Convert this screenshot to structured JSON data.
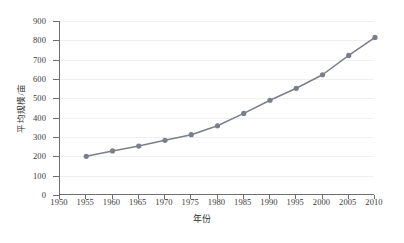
{
  "chart_data": {
    "type": "line",
    "title": "",
    "xlabel": "年份",
    "ylabel": "平均规模/亩",
    "xlim": [
      1950,
      2010
    ],
    "ylim": [
      0,
      900
    ],
    "xticks": [
      1950,
      1955,
      1960,
      1965,
      1970,
      1975,
      1980,
      1985,
      1990,
      1995,
      2000,
      2005,
      2010
    ],
    "yticks": [
      0,
      100,
      200,
      300,
      400,
      500,
      600,
      700,
      800,
      900
    ],
    "grid": true,
    "legend": "none",
    "series_color": "#7b7f8a",
    "marker": "circle",
    "x": [
      1955,
      1960,
      1965,
      1970,
      1975,
      1980,
      1985,
      1990,
      1995,
      2000,
      2005,
      2010
    ],
    "values": [
      200,
      228,
      253,
      283,
      312,
      358,
      422,
      490,
      552,
      622,
      722,
      815
    ],
    "series": [
      {
        "name": "平均规模",
        "points": [
          {
            "x": 1955,
            "y": 200
          },
          {
            "x": 1960,
            "y": 228
          },
          {
            "x": 1965,
            "y": 253
          },
          {
            "x": 1970,
            "y": 283
          },
          {
            "x": 1975,
            "y": 312
          },
          {
            "x": 1980,
            "y": 358
          },
          {
            "x": 1985,
            "y": 422
          },
          {
            "x": 1990,
            "y": 490
          },
          {
            "x": 1995,
            "y": 552
          },
          {
            "x": 2000,
            "y": 622
          },
          {
            "x": 2005,
            "y": 722
          },
          {
            "x": 2010,
            "y": 815
          }
        ]
      }
    ]
  },
  "axis": {
    "y_labels": [
      "900",
      "800",
      "700",
      "600",
      "500",
      "400",
      "300",
      "200",
      "100",
      "0"
    ],
    "y_title": "平均规模/亩",
    "x_labels": [
      "1950",
      "1955",
      "1960",
      "1965",
      "1970",
      "1975",
      "1980",
      "1985",
      "1990",
      "1995",
      "2000",
      "2005",
      "2010"
    ],
    "x_title": "年份"
  }
}
